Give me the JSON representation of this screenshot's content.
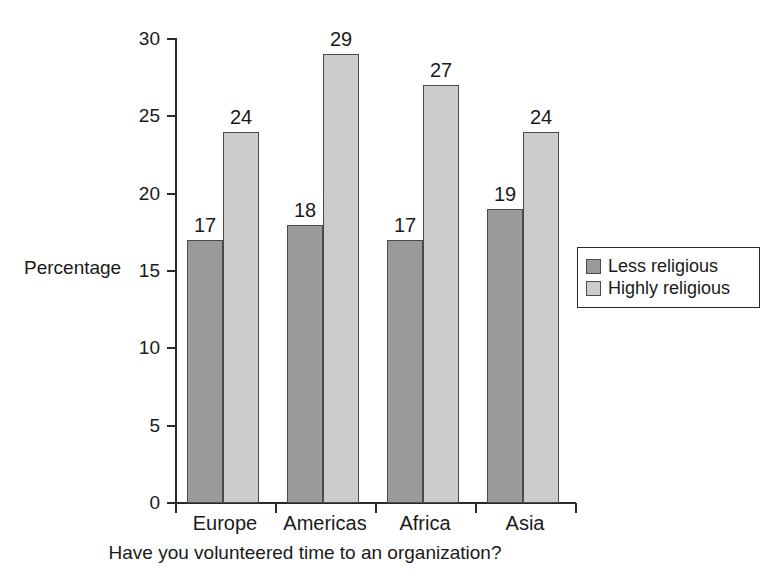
{
  "chart_data": {
    "type": "bar",
    "title": "",
    "subtitle": "",
    "xlabel": "Have you volunteered time to an organization?",
    "ylabel": "Percentage",
    "categories": [
      "Europe",
      "Americas",
      "Africa",
      "Asia"
    ],
    "series": [
      {
        "name": "Less religious",
        "color": "#9a9a9a",
        "values": [
          17,
          18,
          17,
          19
        ]
      },
      {
        "name": "Highly religious",
        "color": "#cccccc",
        "values": [
          24,
          29,
          27,
          24
        ]
      }
    ],
    "ylim": [
      0,
      30
    ],
    "yticks": [
      0,
      5,
      10,
      15,
      20,
      25,
      30
    ],
    "ytick_labels": [
      "0",
      "5",
      "10",
      "15",
      "20",
      "25",
      "30"
    ],
    "grid": false,
    "data_labels": true,
    "legend_position": "right",
    "legend_entries": [
      "Less religious",
      "Highly religious"
    ],
    "bar_value_labels": [
      [
        "17",
        "24"
      ],
      [
        "18",
        "29"
      ],
      [
        "17",
        "27"
      ],
      [
        "19",
        "24"
      ]
    ]
  }
}
